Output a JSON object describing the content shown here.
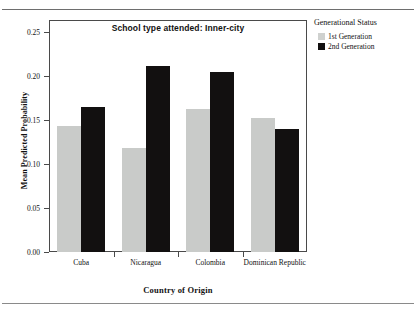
{
  "page": {
    "cut_header_text": " "
  },
  "legend": {
    "title": "Generational Status",
    "entries": [
      {
        "label": "1st Generation",
        "color": "#cfd1cf"
      },
      {
        "label": "2nd Generation",
        "color": "#121010"
      }
    ]
  },
  "chart_data": {
    "type": "bar",
    "title": "School type attended: Inner-city",
    "xlabel": "Country of Origin",
    "ylabel": "Mean Predicted Probability",
    "categories": [
      "Cuba",
      "Nicaragua",
      "Colombia",
      "Dominican Republic"
    ],
    "series": [
      {
        "name": "1st Generation",
        "color": "#c9cbc9",
        "values": [
          0.143,
          0.118,
          0.162,
          0.152
        ]
      },
      {
        "name": "2nd Generation",
        "color": "#121010",
        "values": [
          0.165,
          0.211,
          0.205,
          0.14
        ]
      }
    ],
    "ylim": [
      0.0,
      0.25
    ],
    "ytick_values": [
      0.0,
      0.05,
      0.1,
      0.15,
      0.2,
      0.25
    ],
    "ytick_labels": [
      "0.00",
      "0.05",
      "0.10",
      "0.15",
      "0.20",
      "0.25"
    ],
    "grid": false,
    "legend_position": "right"
  }
}
